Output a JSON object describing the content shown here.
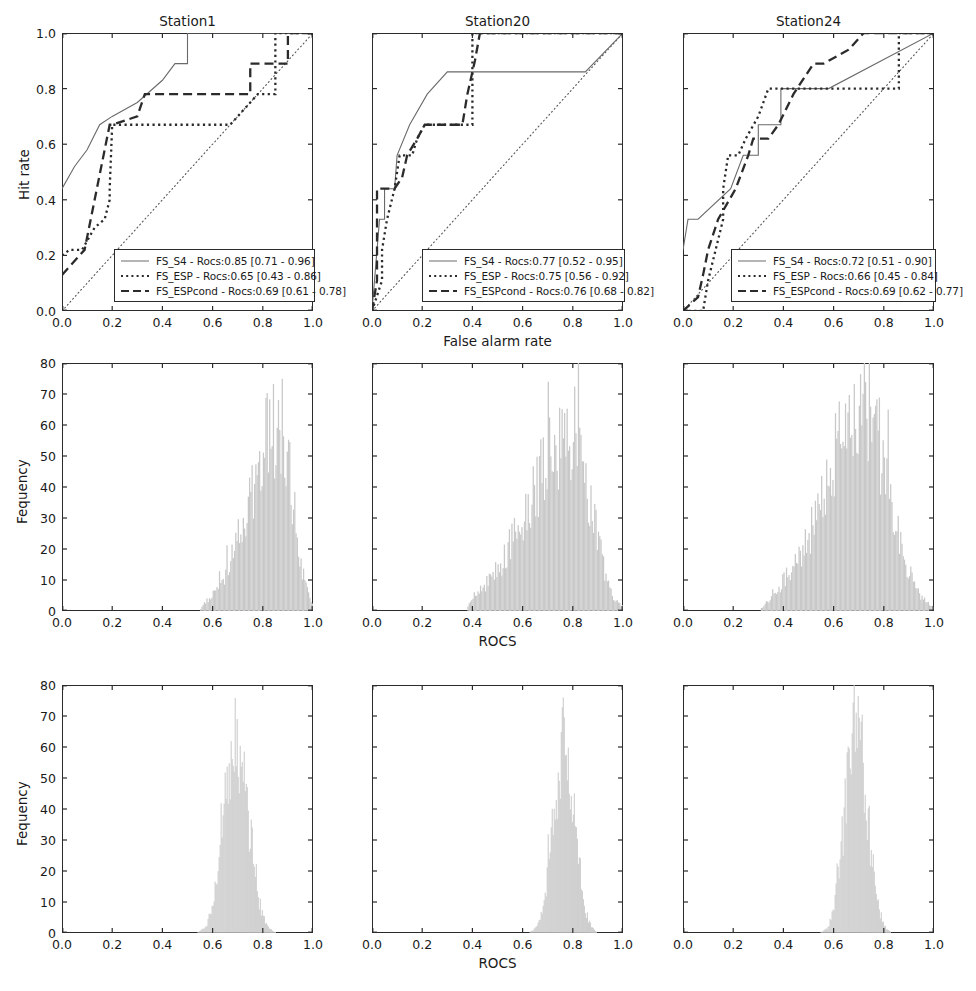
{
  "figure": {
    "rows": 3,
    "cols": 3,
    "background": "#ffffff",
    "axis_color": "#2b2b2b",
    "hist_color": "#c8c8c8",
    "hist_edge": "#b4b4b4"
  },
  "column_titles": [
    "Station1",
    "Station20",
    "Station24"
  ],
  "row1": {
    "xlabel": "False alarm rate",
    "ylabel": "Hit rate",
    "xticks": [
      "0.0",
      "0.2",
      "0.4",
      "0.6",
      "0.8",
      "1.0"
    ],
    "yticks": [
      "0.0",
      "0.2",
      "0.4",
      "0.6",
      "0.8",
      "1.0"
    ]
  },
  "row2": {
    "xlabel": "ROCS",
    "ylabel": "Fequency",
    "xticks": [
      "0.0",
      "0.2",
      "0.4",
      "0.6",
      "0.8",
      "1.0"
    ],
    "yticks": [
      "0",
      "10",
      "20",
      "30",
      "40",
      "50",
      "60",
      "70",
      "80"
    ]
  },
  "row3": {
    "xlabel": "ROCS",
    "ylabel": "Fequency",
    "xticks": [
      "0.0",
      "0.2",
      "0.4",
      "0.6",
      "0.8",
      "1.0"
    ],
    "yticks": [
      "0",
      "10",
      "20",
      "30",
      "40",
      "50",
      "60",
      "70",
      "80"
    ]
  },
  "legends": [
    {
      "station": "Station1",
      "entries": [
        {
          "style": "solid",
          "label": "FS_S4 - Rocs:0.85 [0.71 - 0.96]"
        },
        {
          "style": "dotted",
          "label": "FS_ESP - Rocs:0.65 [0.43 - 0.86]"
        },
        {
          "style": "dashed",
          "label": "FS_ESPcond - Rocs:0.69 [0.61 - 0.78]"
        }
      ]
    },
    {
      "station": "Station20",
      "entries": [
        {
          "style": "solid",
          "label": "FS_S4 - Rocs:0.77 [0.52 - 0.95]"
        },
        {
          "style": "dotted",
          "label": "FS_ESP - Rocs:0.75 [0.56 - 0.92]"
        },
        {
          "style": "dashed",
          "label": "FS_ESPcond - Rocs:0.76 [0.68 - 0.82]"
        }
      ]
    },
    {
      "station": "Station24",
      "entries": [
        {
          "style": "solid",
          "label": "FS_S4 - Rocs:0.72 [0.51 - 0.90]"
        },
        {
          "style": "dotted",
          "label": "FS_ESP - Rocs:0.66 [0.45 - 0.84]"
        },
        {
          "style": "dashed",
          "label": "FS_ESPcond - Rocs:0.69 [0.62 - 0.77]"
        }
      ]
    }
  ],
  "chart_data": [
    {
      "type": "line",
      "panel": "row1-col1",
      "title": "Station1",
      "xlabel": "False alarm rate",
      "ylabel": "Hit rate",
      "xlim": [
        0,
        1
      ],
      "ylim": [
        0,
        1
      ],
      "grid": false,
      "legend_position": "lower right",
      "annotations": [
        "diagonal no-skill reference line from (0,0) to (1,1)"
      ],
      "series": [
        {
          "name": "FS_S4",
          "style": "solid",
          "rocs": 0.85,
          "ci": [
            0.71,
            0.96
          ],
          "points": [
            [
              0.0,
              0.44
            ],
            [
              0.05,
              0.52
            ],
            [
              0.1,
              0.58
            ],
            [
              0.15,
              0.67
            ],
            [
              0.2,
              0.7
            ],
            [
              0.3,
              0.75
            ],
            [
              0.4,
              0.83
            ],
            [
              0.45,
              0.89
            ],
            [
              0.5,
              0.89
            ],
            [
              0.5,
              1.0
            ],
            [
              1.0,
              1.0
            ]
          ]
        },
        {
          "name": "FS_ESP",
          "style": "dotted",
          "rocs": 0.65,
          "ci": [
            0.43,
            0.86
          ],
          "points": [
            [
              0.0,
              0.2
            ],
            [
              0.03,
              0.22
            ],
            [
              0.08,
              0.22
            ],
            [
              0.13,
              0.3
            ],
            [
              0.17,
              0.33
            ],
            [
              0.19,
              0.4
            ],
            [
              0.19,
              0.44
            ],
            [
              0.2,
              0.67
            ],
            [
              0.67,
              0.67
            ],
            [
              0.72,
              0.72
            ],
            [
              0.78,
              0.78
            ],
            [
              0.85,
              0.78
            ],
            [
              0.85,
              0.89
            ],
            [
              0.85,
              1.0
            ],
            [
              1.0,
              1.0
            ]
          ]
        },
        {
          "name": "FS_ESPcond",
          "style": "dashed",
          "rocs": 0.69,
          "ci": [
            0.61,
            0.78
          ],
          "points": [
            [
              0.0,
              0.13
            ],
            [
              0.09,
              0.22
            ],
            [
              0.19,
              0.67
            ],
            [
              0.2,
              0.67
            ],
            [
              0.3,
              0.7
            ],
            [
              0.33,
              0.78
            ],
            [
              0.75,
              0.78
            ],
            [
              0.75,
              0.89
            ],
            [
              0.9,
              0.89
            ],
            [
              0.9,
              1.0
            ],
            [
              1.0,
              1.0
            ]
          ]
        }
      ]
    },
    {
      "type": "line",
      "panel": "row1-col2",
      "title": "Station20",
      "xlabel": "False alarm rate",
      "ylabel": "Hit rate",
      "xlim": [
        0,
        1
      ],
      "ylim": [
        0,
        1
      ],
      "grid": false,
      "legend_position": "lower right",
      "annotations": [
        "diagonal no-skill reference line from (0,0) to (1,1)"
      ],
      "series": [
        {
          "name": "FS_S4",
          "style": "solid",
          "rocs": 0.77,
          "ci": [
            0.52,
            0.95
          ],
          "points": [
            [
              0.0,
              0.0
            ],
            [
              0.03,
              0.33
            ],
            [
              0.05,
              0.33
            ],
            [
              0.05,
              0.44
            ],
            [
              0.09,
              0.44
            ],
            [
              0.1,
              0.56
            ],
            [
              0.15,
              0.67
            ],
            [
              0.22,
              0.78
            ],
            [
              0.3,
              0.86
            ],
            [
              0.85,
              0.86
            ],
            [
              1.0,
              1.0
            ]
          ]
        },
        {
          "name": "FS_ESP",
          "style": "dotted",
          "rocs": 0.75,
          "ci": [
            0.56,
            0.92
          ],
          "points": [
            [
              0.0,
              0.0
            ],
            [
              0.04,
              0.11
            ],
            [
              0.04,
              0.22
            ],
            [
              0.06,
              0.33
            ],
            [
              0.09,
              0.44
            ],
            [
              0.11,
              0.56
            ],
            [
              0.16,
              0.56
            ],
            [
              0.18,
              0.62
            ],
            [
              0.21,
              0.67
            ],
            [
              0.4,
              0.67
            ],
            [
              0.4,
              0.86
            ],
            [
              0.4,
              1.0
            ],
            [
              1.0,
              1.0
            ]
          ]
        },
        {
          "name": "FS_ESPcond",
          "style": "dashed",
          "rocs": 0.76,
          "ci": [
            0.68,
            0.82
          ],
          "points": [
            [
              0.0,
              0.0
            ],
            [
              0.02,
              0.11
            ],
            [
              0.02,
              0.44
            ],
            [
              0.09,
              0.44
            ],
            [
              0.12,
              0.48
            ],
            [
              0.14,
              0.56
            ],
            [
              0.18,
              0.62
            ],
            [
              0.21,
              0.67
            ],
            [
              0.36,
              0.67
            ],
            [
              0.38,
              0.78
            ],
            [
              0.41,
              0.9
            ],
            [
              0.43,
              1.0
            ],
            [
              1.0,
              1.0
            ]
          ]
        }
      ]
    },
    {
      "type": "line",
      "panel": "row1-col3",
      "title": "Station24",
      "xlabel": "False alarm rate",
      "ylabel": "Hit rate",
      "xlim": [
        0,
        1
      ],
      "ylim": [
        0,
        1
      ],
      "grid": false,
      "legend_position": "lower right",
      "annotations": [
        "diagonal no-skill reference line from (0,0) to (1,1)"
      ],
      "series": [
        {
          "name": "FS_S4",
          "style": "solid",
          "rocs": 0.72,
          "ci": [
            0.51,
            0.9
          ],
          "points": [
            [
              0.0,
              0.22
            ],
            [
              0.02,
              0.33
            ],
            [
              0.06,
              0.33
            ],
            [
              0.19,
              0.44
            ],
            [
              0.24,
              0.56
            ],
            [
              0.3,
              0.56
            ],
            [
              0.3,
              0.67
            ],
            [
              0.39,
              0.67
            ],
            [
              0.39,
              0.8
            ],
            [
              0.58,
              0.8
            ],
            [
              1.0,
              1.0
            ]
          ]
        },
        {
          "name": "FS_ESP",
          "style": "dotted",
          "rocs": 0.66,
          "ci": [
            0.45,
            0.84
          ],
          "points": [
            [
              0.0,
              0.0
            ],
            [
              0.08,
              0.0
            ],
            [
              0.1,
              0.11
            ],
            [
              0.13,
              0.22
            ],
            [
              0.16,
              0.33
            ],
            [
              0.16,
              0.44
            ],
            [
              0.18,
              0.56
            ],
            [
              0.22,
              0.56
            ],
            [
              0.25,
              0.62
            ],
            [
              0.3,
              0.7
            ],
            [
              0.34,
              0.8
            ],
            [
              0.86,
              0.8
            ],
            [
              0.86,
              0.94
            ],
            [
              0.86,
              1.0
            ],
            [
              1.0,
              1.0
            ]
          ]
        },
        {
          "name": "FS_ESPcond",
          "style": "dashed",
          "rocs": 0.69,
          "ci": [
            0.62,
            0.77
          ],
          "points": [
            [
              0.0,
              0.0
            ],
            [
              0.06,
              0.05
            ],
            [
              0.08,
              0.13
            ],
            [
              0.1,
              0.22
            ],
            [
              0.14,
              0.33
            ],
            [
              0.21,
              0.44
            ],
            [
              0.26,
              0.56
            ],
            [
              0.28,
              0.62
            ],
            [
              0.3,
              0.62
            ],
            [
              0.34,
              0.62
            ],
            [
              0.38,
              0.67
            ],
            [
              0.44,
              0.78
            ],
            [
              0.52,
              0.89
            ],
            [
              0.56,
              0.89
            ],
            [
              0.66,
              0.94
            ],
            [
              0.72,
              1.0
            ],
            [
              1.0,
              1.0
            ]
          ]
        }
      ]
    },
    {
      "type": "bar",
      "panel": "row2-col1",
      "subtitle": "Bootstrap ROCS distribution - Station1 (row 2)",
      "xlabel": "ROCS",
      "ylabel": "Fequency",
      "xlim": [
        0,
        1
      ],
      "ylim": [
        0,
        80
      ],
      "grid": false,
      "bin_width": 0.005,
      "distribution": {
        "center": 0.87,
        "spread": 0.075,
        "skew": "left",
        "range": [
          0.57,
          1.0
        ],
        "peak_frequency": 60
      }
    },
    {
      "type": "bar",
      "panel": "row2-col2",
      "subtitle": "Bootstrap ROCS distribution - Station20 (row 2)",
      "xlabel": "ROCS",
      "ylabel": "Fequency",
      "xlim": [
        0,
        1
      ],
      "ylim": [
        0,
        80
      ],
      "grid": false,
      "bin_width": 0.005,
      "distribution": {
        "center": 0.8,
        "spread": 0.11,
        "skew": "left",
        "range": [
          0.4,
          1.0
        ],
        "peak_frequency": 56
      }
    },
    {
      "type": "bar",
      "panel": "row2-col3",
      "subtitle": "Bootstrap ROCS distribution - Station24 (row 2)",
      "xlabel": "ROCS",
      "ylabel": "Fequency",
      "xlim": [
        0,
        1
      ],
      "ylim": [
        0,
        80
      ],
      "grid": false,
      "bin_width": 0.005,
      "distribution": {
        "center": 0.72,
        "spread": 0.12,
        "skew": "slight-left",
        "range": [
          0.33,
          1.0
        ],
        "peak_frequency": 65
      }
    },
    {
      "type": "bar",
      "panel": "row3-col1",
      "subtitle": "Bootstrap ROCS distribution - Station1 (row 3)",
      "xlabel": "ROCS",
      "ylabel": "Fequency",
      "xlim": [
        0,
        1
      ],
      "ylim": [
        0,
        80
      ],
      "grid": false,
      "bin_width": 0.004,
      "distribution": {
        "center": 0.695,
        "spread": 0.048,
        "skew": "none",
        "range": [
          0.53,
          0.87
        ],
        "peak_frequency": 63
      }
    },
    {
      "type": "bar",
      "panel": "row3-col2",
      "subtitle": "Bootstrap ROCS distribution - Station20 (row 3)",
      "xlabel": "ROCS",
      "ylabel": "Fequency",
      "xlim": [
        0,
        1
      ],
      "ylim": [
        0,
        80
      ],
      "grid": false,
      "bin_width": 0.004,
      "distribution": {
        "center": 0.765,
        "spread": 0.042,
        "skew": "none",
        "range": [
          0.6,
          0.89
        ],
        "peak_frequency": 62
      }
    },
    {
      "type": "bar",
      "panel": "row3-col3",
      "subtitle": "Bootstrap ROCS distribution - Station24 (row 3)",
      "xlabel": "ROCS",
      "ylabel": "Fequency",
      "xlim": [
        0,
        1
      ],
      "ylim": [
        0,
        80
      ],
      "grid": false,
      "bin_width": 0.004,
      "distribution": {
        "center": 0.69,
        "spread": 0.043,
        "skew": "none",
        "range": [
          0.53,
          0.85
        ],
        "peak_frequency": 70
      }
    }
  ]
}
